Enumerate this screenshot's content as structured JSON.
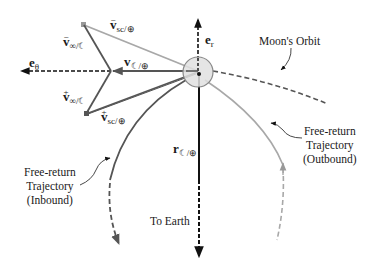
{
  "figure": {
    "colors": {
      "background": "#ffffff",
      "black": "#111111",
      "dark_gray": "#555555",
      "light_gray": "#a8a8a8",
      "moon_fill": "#e0e0e0",
      "moon_stroke": "#888888"
    },
    "vectors": {
      "v_sc_minus": {
        "symbol": "v",
        "sup": "−",
        "sub": "sc/⊕"
      },
      "v_inf_minus": {
        "symbol": "v",
        "sup": "−",
        "sub": "∞/☾"
      },
      "v_moon": {
        "symbol": "v",
        "sub": "☾/⊕"
      },
      "v_inf_plus": {
        "symbol": "v",
        "sup": "+",
        "sub": "∞/☾"
      },
      "v_sc_plus": {
        "symbol": "v",
        "sup": "+",
        "sub": "sc/⊕"
      },
      "r_moon": {
        "symbol": "r",
        "sub": "☾/⊕"
      }
    },
    "unit_vectors": {
      "e_theta": {
        "symbol": "e",
        "sub": "θ"
      },
      "e_r": {
        "symbol": "e",
        "sub": "r"
      }
    },
    "annotations": {
      "moon_orbit": "Moon's Orbit",
      "outbound": [
        "Free-return",
        "Trajectory",
        "(Outbound)"
      ],
      "inbound": [
        "Free-return",
        "Trajectory",
        "(Inbound)"
      ],
      "to_earth": "To Earth"
    }
  }
}
